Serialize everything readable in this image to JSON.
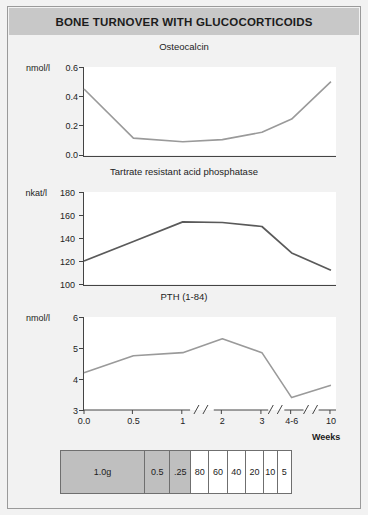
{
  "figure": {
    "title": "BONE TURNOVER WITH GLUCOCORTICOIDS",
    "banner_color": "#c8c8c8",
    "background_color": "#f2f2f2",
    "border_color": "#9a9a9a"
  },
  "axis": {
    "x_label": "Weeks",
    "x_ticks": [
      "0.0",
      "0.5",
      "1",
      "2",
      "3",
      "4-6",
      "10"
    ],
    "breaks_after": [
      "1",
      "3",
      "4-6"
    ]
  },
  "dose_table": {
    "cells": [
      {
        "label": "1.0g",
        "shaded": true
      },
      {
        "label": "0.5",
        "shaded": true
      },
      {
        "label": ".25",
        "shaded": true
      },
      {
        "label": "80",
        "shaded": false
      },
      {
        "label": "60",
        "shaded": false
      },
      {
        "label": "40",
        "shaded": false
      },
      {
        "label": "20",
        "shaded": false
      },
      {
        "label": "10",
        "shaded": false
      },
      {
        "label": "5",
        "shaded": false
      }
    ]
  },
  "chart_data": [
    {
      "type": "line",
      "title": "Osteocalcin",
      "ylabel": "nmol/l",
      "xlabel": "Weeks",
      "ylim": [
        0.0,
        0.6
      ],
      "yticks": [
        "0.6",
        "0.4",
        "0.2",
        "0.0"
      ],
      "ytick_values": [
        0.6,
        0.4,
        0.2,
        0.0
      ],
      "categories": [
        "0.0",
        "0.5",
        "1",
        "2",
        "3",
        "4-6",
        "10"
      ],
      "values": [
        0.45,
        0.115,
        0.09,
        0.105,
        0.155,
        0.245,
        0.5
      ],
      "line_color": "#9a9a9a",
      "grid": false,
      "legend": "none"
    },
    {
      "type": "line",
      "title": "Tartrate resistant acid phosphatase",
      "ylabel": "nkat/l",
      "xlabel": "Weeks",
      "ylim": [
        100,
        180
      ],
      "yticks": [
        "180",
        "160",
        "140",
        "120",
        "100"
      ],
      "ytick_values": [
        180,
        160,
        140,
        120,
        100
      ],
      "categories": [
        "0.0",
        "0.5",
        "1",
        "2",
        "3",
        "4-6",
        "10"
      ],
      "values": [
        120,
        137,
        154,
        153.5,
        150,
        127,
        112
      ],
      "line_color": "#5a5a5a",
      "grid": false,
      "legend": "none"
    },
    {
      "type": "line",
      "title": "PTH (1-84)",
      "ylabel": "nmol/l",
      "xlabel": "Weeks",
      "ylim": [
        3,
        6
      ],
      "yticks": [
        "6",
        "5",
        "4",
        "3"
      ],
      "ytick_values": [
        6,
        5,
        4,
        3
      ],
      "categories": [
        "0.0",
        "0.5",
        "1",
        "2",
        "3",
        "4-6",
        "10"
      ],
      "values": [
        4.2,
        4.75,
        4.85,
        5.3,
        4.85,
        3.4,
        3.8
      ],
      "line_color": "#9a9a9a",
      "grid": false,
      "legend": "none"
    }
  ]
}
